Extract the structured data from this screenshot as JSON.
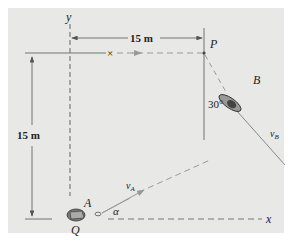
{
  "figure": {
    "background_color": "#e8e8e6",
    "line_color": "#555555",
    "dash_color": "#8a8a8a",
    "labels": {
      "y_axis": "y",
      "x_axis": "x",
      "point_p": "P",
      "boat_a": "A",
      "boat_b": "B",
      "point_q": "Q",
      "velocity_a": "v",
      "velocity_a_sub": "A",
      "velocity_b": "v",
      "velocity_b_sub": "B",
      "angle_alpha": "α",
      "angle_b": "30°",
      "dim_horizontal": "15 m",
      "dim_vertical": "15 m",
      "cross_mark": "×"
    }
  }
}
